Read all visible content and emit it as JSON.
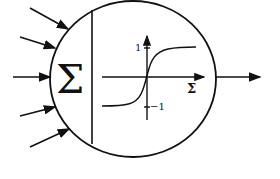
{
  "diagram": {
    "summation_symbol": "Σ",
    "activation": {
      "y_tick_top": "1",
      "y_tick_bottom": "−1",
      "x_axis_label": "Σ",
      "curve": "sigmoid / tanh"
    },
    "inputs_count": 5,
    "outputs_count": 1,
    "colors": {
      "stroke": "#111111",
      "background": "#ffffff"
    }
  }
}
